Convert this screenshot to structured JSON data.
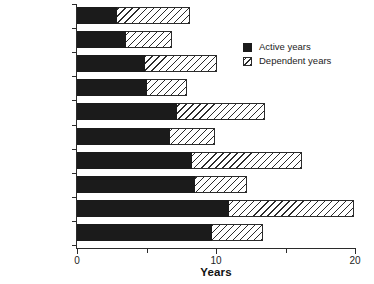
{
  "chart_data": {
    "type": "bar",
    "orientation": "horizontal",
    "stacked": true,
    "title": "",
    "xlabel": "Years",
    "ylabel": "",
    "xlim": [
      0,
      20
    ],
    "xticks": [
      0,
      5,
      10,
      15,
      20
    ],
    "xtick_labels": [
      "0",
      "",
      "10",
      "",
      "20"
    ],
    "grid": false,
    "legend_position": "upper right",
    "categories": [
      "Female, 85+",
      "Male, 85+",
      "Female, 80-84",
      "Male, 80-84",
      "Female, 75-79",
      "Male, 75-79",
      "Female, 70-74",
      "Male, 70-74",
      "Female, 65-69",
      "Male, 65-69"
    ],
    "series": [
      {
        "name": "Active years",
        "color": "#1b1b1b",
        "fill": "solid",
        "values": [
          2.9,
          3.5,
          4.9,
          5.0,
          7.2,
          6.7,
          8.3,
          8.5,
          10.9,
          9.7
        ]
      },
      {
        "name": "Dependent years",
        "color": "#ffffff",
        "fill": "hatched",
        "values": [
          5.2,
          3.3,
          5.2,
          2.9,
          6.3,
          3.2,
          7.9,
          3.7,
          9.0,
          3.7
        ]
      }
    ],
    "totals": [
      8.1,
      6.8,
      10.1,
      7.9,
      13.5,
      9.9,
      16.2,
      12.2,
      19.9,
      13.4
    ]
  },
  "legend": {
    "items": [
      {
        "label": "Active years",
        "swatch": "solid-black-square"
      },
      {
        "label": "Dependent years",
        "swatch": "hatched-square"
      }
    ]
  }
}
